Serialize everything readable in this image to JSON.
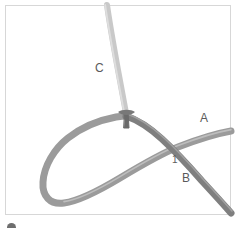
{
  "figure": {
    "frame": {
      "x": 5,
      "y": 5,
      "width": 226,
      "height": 210,
      "border_color": "#d7d7d7",
      "background": "#ffffff"
    },
    "labels": [
      {
        "id": "C",
        "text": "C",
        "x": 95,
        "y": 62,
        "color": "#5a5a5a"
      },
      {
        "id": "A",
        "text": "A",
        "x": 200,
        "y": 112,
        "color": "#5a5a5a"
      },
      {
        "id": "B",
        "text": "B",
        "x": 182,
        "y": 172,
        "color": "#5a5a5a"
      },
      {
        "id": "1",
        "text": "1",
        "x": 172,
        "y": 155,
        "color": "#5d5d5d"
      }
    ],
    "strands": [
      {
        "id": "C",
        "name": "light-vertical-strand",
        "color": "#c9c9c9",
        "width": 6,
        "description": "light gray strand entering from top edge, curving down to the junction stub"
      },
      {
        "id": "loop",
        "name": "medium-loop-strand",
        "color": "#9b9b9b",
        "width": 7,
        "description": "medium gray strand forming a large left-hand loop passing under the crossing and exiting right as A"
      },
      {
        "id": "B",
        "name": "dark-diagonal-strand",
        "color": "#7f7f7f",
        "width": 7,
        "description": "darker gray strand running from the junction down-right over the crossing and off the bottom-right corner"
      }
    ],
    "junction": {
      "name": "knot-junction-stub",
      "x": 126,
      "y": 118,
      "color": "#6b6b6b",
      "description": "dark stub where strand C terminates into the knot"
    },
    "crossing": {
      "name": "crossing-1",
      "label": "1",
      "x": 172,
      "y": 148,
      "over_strand": "B",
      "under_strand": "loop"
    },
    "bottom_marker": {
      "name": "cropped-bullet",
      "x": 7,
      "y": 223,
      "diameter": 9,
      "color": "#6e6e6e"
    }
  }
}
